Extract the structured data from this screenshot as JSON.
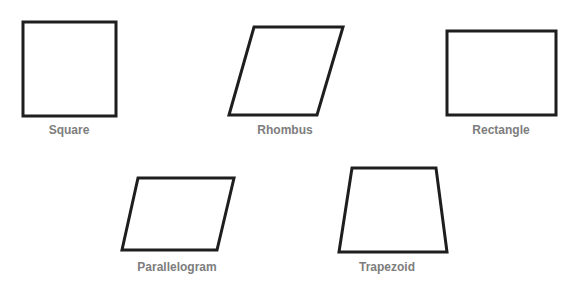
{
  "diagram": {
    "stroke_color": "#1e1e1e",
    "label_color": "#7d7d7d",
    "shapes": [
      {
        "name": "square",
        "label": "Square",
        "points": "23,22 116,22 116,116 23,116",
        "label_x": 69,
        "label_y": 123
      },
      {
        "name": "rhombus",
        "label": "Rhombus",
        "points": "254,27 343,27 317,115 229,115",
        "label_x": 285,
        "label_y": 123
      },
      {
        "name": "rectangle",
        "label": "Rectangle",
        "points": "447,31 556,31 556,115 447,115",
        "label_x": 501,
        "label_y": 123
      },
      {
        "name": "parallelogram",
        "label": "Parallelogram",
        "points": "138,178 234,178 217,250 122,250",
        "label_x": 177,
        "label_y": 260
      },
      {
        "name": "trapezoid",
        "label": "Trapezoid",
        "points": "352,168 436,168 447,252 339,252",
        "label_x": 387,
        "label_y": 260
      }
    ]
  }
}
